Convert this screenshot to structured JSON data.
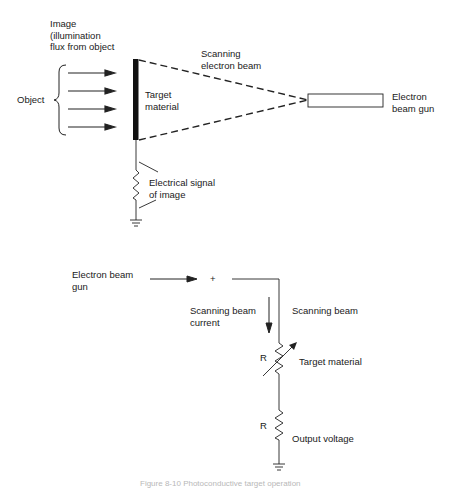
{
  "top_diagram": {
    "image_label": [
      "Image",
      "(illumination",
      "flux from object"
    ],
    "object_label": "Object",
    "target_label": [
      "Target",
      "material"
    ],
    "beam_label": [
      "Scanning",
      "electron beam"
    ],
    "gun_label": [
      "Electron",
      "beam gun"
    ],
    "signal_label": [
      "Electrical signal",
      "of image"
    ],
    "arrow_count": 4
  },
  "bottom_diagram": {
    "gun_label": [
      "Electron beam",
      "gun"
    ],
    "plus_sign": "+",
    "current_label": [
      "Scanning beam",
      "current"
    ],
    "beam_label": "Scanning beam",
    "resistor1_label": "R",
    "target_label": "Target material",
    "resistor2_label": "R",
    "output_label": "Output voltage"
  },
  "caption": "Figure 8-10  Photoconductive target operation"
}
